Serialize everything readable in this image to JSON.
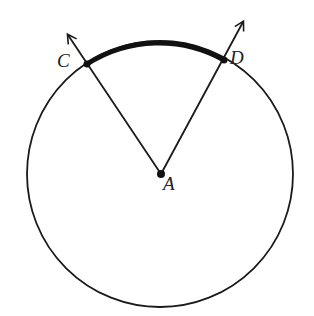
{
  "diagram": {
    "type": "circle-central-angle",
    "colors": {
      "stroke": "#1a1a1a",
      "background": "#ffffff"
    },
    "circle": {
      "cx": 160,
      "cy": 174,
      "r": 133
    },
    "center": {
      "label": "A",
      "x": 161,
      "y": 174
    },
    "points": [
      {
        "label": "C",
        "x": 87,
        "y": 64,
        "ray_tip": {
          "x": 68,
          "y": 35
        }
      },
      {
        "label": "D",
        "x": 224,
        "y": 60,
        "ray_tip": {
          "x": 243,
          "y": 22
        }
      }
    ],
    "highlighted_arc": {
      "from": "C",
      "to": "D",
      "stroke_width": 5
    }
  }
}
